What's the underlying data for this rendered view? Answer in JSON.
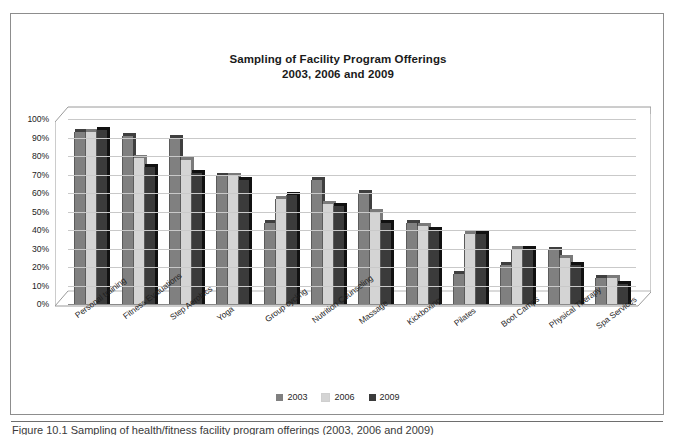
{
  "figure": {
    "caption": "Figure 10.1 Sampling of health/fitness facility program offerings (2003, 2006 and 2009)"
  },
  "legend": {
    "position": "bottom-center",
    "items": [
      {
        "label": "2003",
        "color": "#808080"
      },
      {
        "label": "2006",
        "color": "#d4d4d4"
      },
      {
        "label": "2009",
        "color": "#3b3b3b"
      }
    ]
  },
  "chart_data": {
    "type": "bar",
    "title": "Sampling of Facility Program Offerings\n2003, 2006 and 2009",
    "title_line1": "Sampling of Facility Program Offerings",
    "title_line2": "2003, 2006 and 2009",
    "xlabel": "",
    "ylabel": "",
    "ylim": [
      0,
      100
    ],
    "ytick_labels": [
      "100%",
      "90%",
      "80%",
      "70%",
      "60%",
      "50%",
      "40%",
      "30%",
      "20%",
      "10%",
      "0%"
    ],
    "ytick_values": [
      100,
      90,
      80,
      70,
      60,
      50,
      40,
      30,
      20,
      10,
      0
    ],
    "grid": true,
    "legend_position": "bottom",
    "categories": [
      "Personal training",
      "Fitness Evaluations",
      "Step Aerobics",
      "Yoga",
      "Group cycling",
      "Nutrition Counseling",
      "Massage",
      "Kickboxing",
      "Pilates",
      "Boot Camps",
      "Physical Therapy",
      "Spa Services"
    ],
    "series": [
      {
        "name": "2003",
        "color": "#808080",
        "values": [
          93,
          91,
          90,
          69,
          44,
          67,
          60,
          44,
          16,
          21,
          29,
          14
        ]
      },
      {
        "name": "2006",
        "color": "#d4d4d4",
        "values": [
          93,
          79,
          78,
          69,
          57,
          54,
          50,
          42,
          38,
          30,
          25,
          14
        ]
      },
      {
        "name": "2009",
        "color": "#3b3b3b",
        "values": [
          94,
          74,
          71,
          67,
          59,
          53,
          44,
          40,
          38,
          30,
          21,
          11
        ]
      }
    ]
  }
}
